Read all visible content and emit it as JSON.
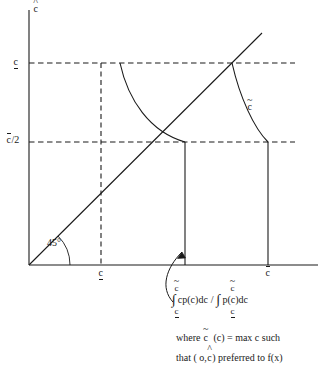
{
  "figure": {
    "type": "diagram",
    "title": "",
    "background": "#ffffff",
    "stroke_color": "#1a1a1a",
    "axes": {
      "y_axis_label": "c",
      "y_axis_label_accent": "hat",
      "x_axis_label": "",
      "origin_label": ""
    },
    "y_ticks": [
      {
        "id": "c-under",
        "label": "c",
        "accent": "underbar",
        "y_px": 63,
        "dashed": true
      },
      {
        "id": "cbar-half",
        "label": "c/2",
        "accent": "overbar-on-c",
        "y_px": 142,
        "dashed": true
      }
    ],
    "x_ticks": [
      {
        "id": "c-under-x",
        "label": "c",
        "accent": "underbar",
        "x_px": 101
      },
      {
        "id": "cbar-x",
        "label": "c",
        "accent": "overbar",
        "x_px": 268
      }
    ],
    "angle_annotation": {
      "text": "45°",
      "x_px": 47,
      "y_px": 243
    },
    "curve_label": {
      "text": "c",
      "accent": "tilde",
      "x_px": 249,
      "y_px": 105
    },
    "lines": {
      "diagonal_45_deg": true,
      "vertical_solid_left_x_px": 185,
      "vertical_solid_right_x_px": 268,
      "dashed_vertical_x_px": 101
    }
  },
  "annotation": {
    "numerator_upper_limit": "c",
    "numerator_upper_limit_accent": "tilde",
    "numerator_lower_limit": "c",
    "numerator_lower_limit_accent": "underbar",
    "numerator_body": "cp(c)dc",
    "divider": "/",
    "denominator_upper_limit": "c",
    "denominator_upper_limit_accent": "tilde",
    "denominator_lower_limit": "c",
    "denominator_lower_limit_accent": "underbar",
    "denominator_body": "p(c)dc",
    "integral_symbol": "∫",
    "where_prefix": "where",
    "where_ctilde": "c",
    "where_chat_paren": "(c) = max c such",
    "line2_prefix": "that ( o,",
    "line2_chat": "c",
    "line2_suffix": ") preferred to f(x)"
  }
}
